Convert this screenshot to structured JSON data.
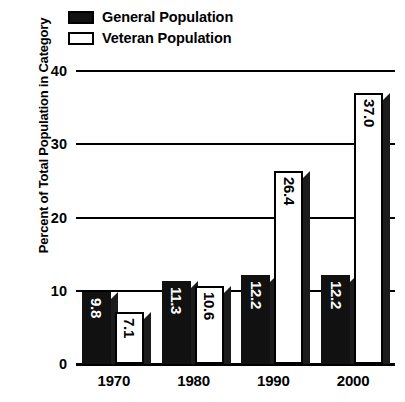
{
  "chart_data": {
    "type": "bar",
    "title": "",
    "subtitle": "",
    "xlabel": "",
    "ylabel": "Percent of Total Population in Category",
    "categories": [
      "1970",
      "1980",
      "1990",
      "2000"
    ],
    "series": [
      {
        "name": "General Population",
        "swatch": "filled-black",
        "color": "#111111",
        "values": [
          9.8,
          11.3,
          12.2,
          12.2
        ],
        "value_labels": [
          "9.8",
          "11.3",
          "12.2",
          "12.2"
        ]
      },
      {
        "name": "Veteran Population",
        "swatch": "hollow-white",
        "color": "#ffffff",
        "values": [
          7.1,
          10.6,
          26.4,
          37.0
        ],
        "value_labels": [
          "7.1",
          "10.6",
          "26.4",
          "37.0"
        ]
      }
    ],
    "ylim": [
      0,
      40
    ],
    "yticks": [
      0,
      10,
      20,
      30,
      40
    ],
    "ytick_labels": [
      "0",
      "10",
      "20",
      "30",
      "40"
    ],
    "grid": true,
    "grid_axis": "y",
    "legend_position": "top-left",
    "value_labels_rotated": true,
    "bar_style": "3d-beveled",
    "annotations": []
  },
  "legend": {
    "items": [
      {
        "label": "General Population"
      },
      {
        "label": "Veteran Population"
      }
    ]
  }
}
